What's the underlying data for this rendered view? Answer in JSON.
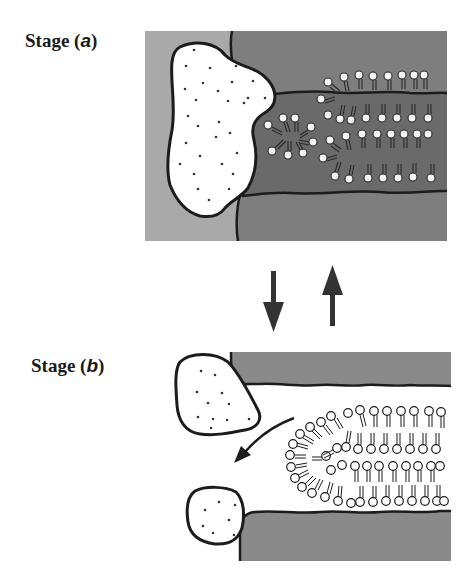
{
  "labels": {
    "stage_a": {
      "prefix": "Stage (",
      "letter": "a",
      "suffix": ")"
    },
    "stage_b": {
      "prefix": "Stage (",
      "letter": "b",
      "suffix": ")"
    }
  },
  "arrows": {
    "transition_down": "arrow-down",
    "transition_up": "arrow-up",
    "stage_b_outflow": "curved-arrow-left"
  },
  "colors": {
    "background": "#ffffff",
    "stage_a_left_region": "#a9a9a9",
    "stage_a_wall": "#7e7e7e",
    "stage_a_channel": "#6a6a6a",
    "stage_b_wall": "#8a8a8a",
    "outline": "#1c1c1c",
    "droplet_fill": "#ffffff",
    "lipid_head_a": "#f4f4f4",
    "lipid_head_b": "#ffffff"
  }
}
